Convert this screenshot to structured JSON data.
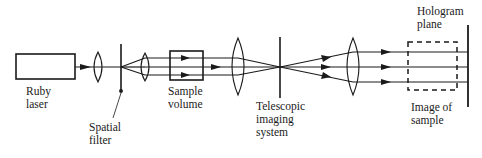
{
  "diagram": {
    "type": "optical-setup",
    "labels": {
      "ruby_laser": [
        "Ruby",
        "laser"
      ],
      "spatial_filter": [
        "Spatial",
        "filter"
      ],
      "sample_volume": [
        "Sample",
        "volume"
      ],
      "telescopic_system": [
        "Telescopic",
        "imaging",
        "system"
      ],
      "hologram_plane": [
        "Hologram",
        "plane"
      ],
      "image_of_sample": [
        "Image of",
        "sample"
      ]
    },
    "colors": {
      "ink": "#1a1a1a",
      "background": "#ffffff"
    }
  }
}
